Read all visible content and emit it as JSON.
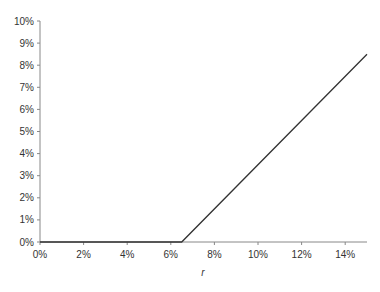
{
  "chart_data": {
    "type": "line",
    "title": "",
    "xlabel": "r",
    "ylabel": "",
    "xlim": [
      0,
      15
    ],
    "ylim": [
      0,
      10
    ],
    "x_ticks": [
      "0%",
      "2%",
      "4%",
      "6%",
      "8%",
      "10%",
      "12%",
      "14%"
    ],
    "x_tick_values": [
      0,
      2,
      4,
      6,
      8,
      10,
      12,
      14
    ],
    "y_ticks": [
      "0%",
      "1%",
      "2%",
      "3%",
      "4%",
      "5%",
      "6%",
      "7%",
      "8%",
      "9%",
      "10%"
    ],
    "y_tick_values": [
      0,
      1,
      2,
      3,
      4,
      5,
      6,
      7,
      8,
      9,
      10
    ],
    "grid": false,
    "legend": null,
    "series": [
      {
        "name": "payoff",
        "color": "#333333",
        "x": [
          0,
          6.5,
          15
        ],
        "y": [
          0,
          0,
          8.5
        ]
      }
    ]
  },
  "colors": {
    "axis": "#888888",
    "line": "#333333",
    "text": "#333333"
  }
}
